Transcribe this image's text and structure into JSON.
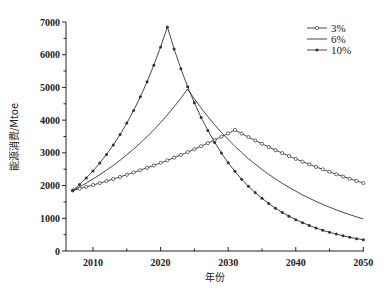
{
  "chart_data": {
    "type": "line",
    "title": "",
    "xlabel": "年份",
    "ylabel": "能源消费/Mtoe",
    "xlim": [
      2006,
      2050
    ],
    "ylim": [
      0,
      7000
    ],
    "xticks": [
      2010,
      2020,
      2030,
      2040,
      2050
    ],
    "yticks": [
      0,
      1000,
      2000,
      3000,
      4000,
      5000,
      6000,
      7000
    ],
    "grid": false,
    "legend_position": "upper right",
    "x": [
      2007,
      2008,
      2009,
      2010,
      2011,
      2012,
      2013,
      2014,
      2015,
      2016,
      2017,
      2018,
      2019,
      2020,
      2021,
      2022,
      2023,
      2024,
      2025,
      2026,
      2027,
      2028,
      2029,
      2030,
      2031,
      2032,
      2033,
      2034,
      2035,
      2036,
      2037,
      2038,
      2039,
      2040,
      2041,
      2042,
      2043,
      2044,
      2045,
      2046,
      2047,
      2048,
      2049,
      2050
    ],
    "series": [
      {
        "name": "3%",
        "marker": "open-circle",
        "values": [
          1850,
          1904,
          1960,
          2018,
          2077,
          2138,
          2200,
          2265,
          2331,
          2399,
          2470,
          2542,
          2617,
          2693,
          2772,
          2854,
          2937,
          3023,
          3112,
          3203,
          3297,
          3394,
          3493,
          3596,
          3700,
          3589,
          3482,
          3378,
          3277,
          3179,
          3084,
          2992,
          2902,
          2815,
          2731,
          2650,
          2570,
          2494,
          2419,
          2347,
          2276,
          2208,
          2142,
          2078
        ]
      },
      {
        "name": "6%",
        "marker": "none",
        "values": [
          1850,
          1960,
          2077,
          2201,
          2332,
          2471,
          2618,
          2774,
          2940,
          3115,
          3300,
          3497,
          3705,
          3926,
          4160,
          4408,
          4671,
          4950,
          4651,
          4370,
          4106,
          3858,
          3625,
          3406,
          3200,
          3007,
          2825,
          2655,
          2494,
          2344,
          2202,
          2069,
          1944,
          1827,
          1716,
          1613,
          1515,
          1424,
          1338,
          1257,
          1181,
          1110,
          1043,
          980
        ]
      },
      {
        "name": "10%",
        "marker": "filled-dot",
        "values": [
          1850,
          2031,
          2230,
          2449,
          2689,
          2953,
          3242,
          3560,
          3909,
          4292,
          4712,
          5174,
          5681,
          6238,
          6850,
          6177,
          5570,
          5022,
          4529,
          4083,
          3682,
          3320,
          2994,
          2699,
          2434,
          2195,
          1979,
          1785,
          1609,
          1451,
          1308,
          1180,
          1064,
          959,
          865,
          780,
          703,
          634,
          572,
          516,
          465,
          419,
          378,
          341
        ]
      }
    ]
  },
  "colors": {
    "line": "#333333",
    "axis": "#222222",
    "background": "#ffffff"
  }
}
